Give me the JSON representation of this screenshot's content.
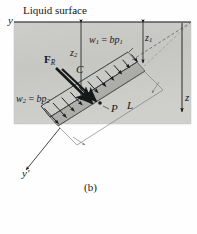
{
  "figure": {
    "caption": "(b)",
    "surface_label": "Liquid surface",
    "axes": {
      "y": "y",
      "y_prime": "y'",
      "z": "z"
    },
    "dimensions": [
      {
        "name": "z1",
        "base": "z",
        "sub": "1"
      },
      {
        "name": "z2",
        "base": "z",
        "sub": "2"
      },
      {
        "name": "L",
        "base": "L",
        "sub": ""
      }
    ],
    "points": [
      {
        "name": "C",
        "label": "C"
      },
      {
        "name": "P",
        "label": "P"
      }
    ],
    "force": {
      "base": "F",
      "sub": "R"
    },
    "pressure_top": {
      "lhs": "w",
      "lhs_sub": "1",
      "eq": "=",
      "rhs": "bp",
      "rhs_sub": "1"
    },
    "pressure_bottom": {
      "lhs": "w",
      "lhs_sub": "2",
      "eq": "=",
      "rhs": "bp",
      "rhs_sub": "2"
    },
    "colors": {
      "liquid": "#c9c9c6",
      "plate": "#b5b5b2",
      "ink": "#16181a",
      "thin_line": "#6f7173",
      "background": "#fefefe"
    }
  }
}
